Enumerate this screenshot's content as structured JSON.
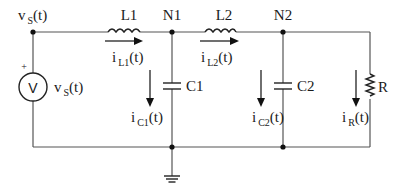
{
  "diagram": {
    "type": "circuit-schematic",
    "colors": {
      "wire": "#555555",
      "component": "#222222",
      "background": "#ffffff"
    },
    "nodes": [
      {
        "id": "vs",
        "label_main": "v",
        "label_sub": "S",
        "label_tail": "(t)"
      },
      {
        "id": "N1",
        "label": "N1"
      },
      {
        "id": "N2",
        "label": "N2"
      },
      {
        "id": "gnd",
        "label": "ground"
      }
    ],
    "components": {
      "source": {
        "symbol": "V",
        "polarity": "+",
        "label_main": "v",
        "label_sub": "S",
        "label_tail": "(t)"
      },
      "L1": {
        "label": "L1"
      },
      "L2": {
        "label": "L2"
      },
      "C1": {
        "label": "C1"
      },
      "C2": {
        "label": "C2"
      },
      "R": {
        "label": "R"
      }
    },
    "currents": {
      "iL1": {
        "main": "i",
        "sub": "L1",
        "tail": "(t)"
      },
      "iL2": {
        "main": "i",
        "sub": "L2",
        "tail": "(t)"
      },
      "iC1": {
        "main": "i",
        "sub": "C1",
        "tail": "(t)"
      },
      "iC2": {
        "main": "i",
        "sub": "C2",
        "tail": "(t)"
      },
      "iR": {
        "main": "i",
        "sub": "R",
        "tail": "(t)"
      }
    }
  }
}
